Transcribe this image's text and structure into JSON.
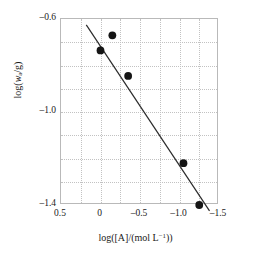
{
  "chart_data": {
    "type": "scatter",
    "title": "",
    "xlabel": "log([A]/(mol L⁻¹))",
    "ylabel": "log(wₐ/g)",
    "xlim": [
      0.5,
      -1.5
    ],
    "ylim": [
      -0.6,
      -1.4
    ],
    "x_reversed": true,
    "y_reversed": true,
    "grid": true,
    "grid_style": "dotted",
    "grid_columns": 8,
    "grid_rows": 8,
    "legend": "none",
    "xticks": [
      0.5,
      0.0,
      -0.5,
      -1.0,
      -1.5
    ],
    "xticklabels": [
      "0.5",
      "0",
      "–0.5",
      "–1.0",
      "–1.5"
    ],
    "yticks": [
      -1.4,
      -1.0,
      -0.6
    ],
    "yticklabels": [
      "–1.4",
      "–1.0",
      "–0.6"
    ],
    "series": [
      {
        "name": "data",
        "marker": "filled-circle",
        "marker_color": "#151515",
        "marker_size": 5.4,
        "x": [
          -0.15,
          0.0,
          -0.35,
          -1.05,
          -1.25
        ],
        "y": [
          -0.67,
          -0.735,
          -0.845,
          -1.22,
          -1.4
        ]
      },
      {
        "name": "linear-fit",
        "type": "line",
        "line_color": "#2b2b2b",
        "line_width": 1.2,
        "x": [
          0.18,
          -1.38
        ],
        "y": [
          -0.625,
          -1.425
        ]
      }
    ],
    "points": [
      {
        "x": -0.15,
        "y": -0.67
      },
      {
        "x": 0.0,
        "y": -0.735
      },
      {
        "x": -0.35,
        "y": -0.845
      },
      {
        "x": -1.05,
        "y": -1.22
      },
      {
        "x": -1.25,
        "y": -1.4
      }
    ]
  },
  "axes": {
    "x_tick_labels": [
      "0.5",
      "0",
      "–0.5",
      "–1.0",
      "–1.5"
    ],
    "y_tick_labels": [
      "–1.4",
      "–1.0",
      "–0.6"
    ]
  },
  "labels": {
    "x_axis_title": "log([A]/(mol L⁻¹))",
    "y_axis_title": "log(wₐ/g)"
  }
}
